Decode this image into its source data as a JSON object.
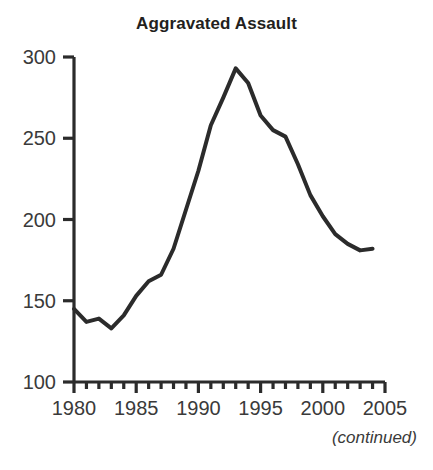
{
  "figure": {
    "title": "Aggravated Assault",
    "footnote": "(continued)"
  },
  "chart_data": {
    "type": "line",
    "title": "Aggravated Assault",
    "xlabel": "",
    "ylabel": "",
    "xlim": [
      1980,
      2005
    ],
    "ylim": [
      100,
      300
    ],
    "xticks": [
      1980,
      1985,
      1990,
      1995,
      2000,
      2005
    ],
    "xtick_labels": [
      "1980",
      "1985",
      "1990",
      "1995",
      "2000",
      "2005"
    ],
    "yticks": [
      100,
      150,
      200,
      250,
      300
    ],
    "ytick_labels": [
      "100",
      "150",
      "200",
      "250",
      "300"
    ],
    "minor_xtick_interval": 1,
    "grid": false,
    "legend": null,
    "line_color": "#2b2b2b",
    "line_width": 4,
    "annotations": [
      "(continued)"
    ],
    "x": [
      1980,
      1981,
      1982,
      1983,
      1984,
      1985,
      1986,
      1987,
      1988,
      1989,
      1990,
      1991,
      1992,
      1993,
      1994,
      1995,
      1996,
      1997,
      1998,
      1999,
      2000,
      2001,
      2002,
      2003,
      2004
    ],
    "values": [
      145,
      137,
      139,
      133,
      141,
      153,
      162,
      166,
      182,
      206,
      230,
      258,
      275,
      293,
      284,
      264,
      255,
      251,
      234,
      215,
      202,
      191,
      185,
      181,
      182
    ],
    "series": [
      {
        "name": "Aggravated assault rate",
        "values": [
          145,
          137,
          139,
          133,
          141,
          153,
          162,
          166,
          182,
          206,
          230,
          258,
          275,
          293,
          284,
          264,
          255,
          251,
          234,
          215,
          202,
          191,
          185,
          181,
          182
        ]
      }
    ]
  }
}
